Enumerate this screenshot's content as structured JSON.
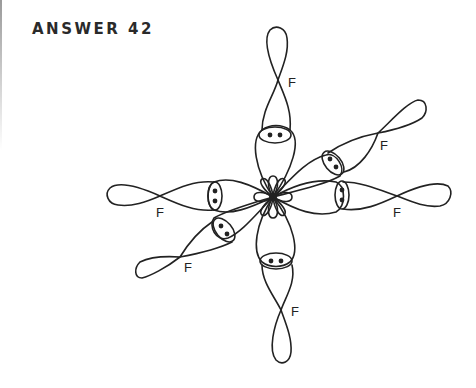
{
  "title": "ANSWER 42",
  "diagram": {
    "center_label": "",
    "arms": [
      {
        "direction": "up",
        "label": "F",
        "lone_pair": true
      },
      {
        "direction": "down",
        "label": "F",
        "lone_pair": true
      },
      {
        "direction": "left",
        "label": "F",
        "lone_pair": true
      },
      {
        "direction": "right",
        "label": "F",
        "lone_pair": true
      },
      {
        "direction": "upper-right",
        "label": "F",
        "lone_pair": true
      },
      {
        "direction": "lower-left",
        "label": "F",
        "lone_pair": true
      }
    ],
    "line_color": "#222222",
    "background": "#ffffff"
  }
}
